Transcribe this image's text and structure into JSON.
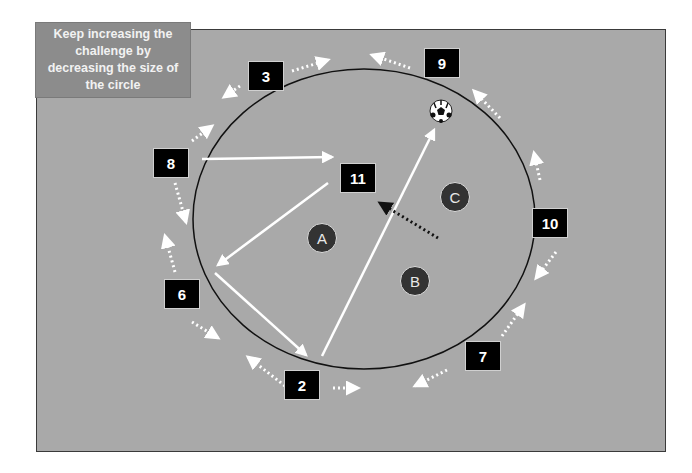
{
  "note": {
    "lines": [
      "Keep increasing the",
      "challenge by",
      "decreasing the size of",
      "the circle"
    ],
    "text": "Keep increasing the challenge by decreasing the size of the circle"
  },
  "colors": {
    "field": "#a9a9a9",
    "note_bg": "#8c8c8c",
    "player_box": "#000000",
    "defender": "#333333",
    "pass_line": "#ffffff",
    "circle": "#111111"
  },
  "attackers": [
    {
      "label": "3",
      "x": 248,
      "y": 61
    },
    {
      "label": "9",
      "x": 427,
      "y": 48
    },
    {
      "label": "8",
      "x": 154,
      "y": 148
    },
    {
      "label": "11",
      "x": 340,
      "y": 164
    },
    {
      "label": "10",
      "x": 532,
      "y": 208
    },
    {
      "label": "6",
      "x": 165,
      "y": 281
    },
    {
      "label": "7",
      "x": 465,
      "y": 342
    },
    {
      "label": "2",
      "x": 285,
      "y": 371
    }
  ],
  "defenders": [
    {
      "label": "A",
      "x": 307,
      "y": 225
    },
    {
      "label": "B",
      "x": 400,
      "y": 266
    },
    {
      "label": "C",
      "x": 440,
      "y": 183
    }
  ],
  "ball": {
    "icon": "soccer-ball-icon",
    "x": 441,
    "y": 111
  }
}
